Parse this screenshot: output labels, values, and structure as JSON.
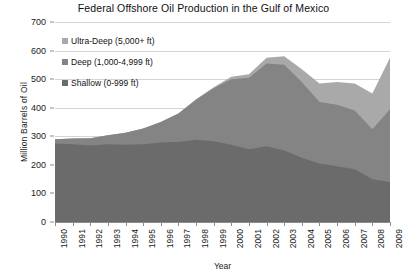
{
  "chart_data": {
    "type": "area",
    "stacked": true,
    "title": "Federal Offshore Oil Production in the Gulf of Mexico",
    "xlabel": "Year",
    "ylabel": "Million Barrels of Oil",
    "ylim": [
      0,
      700
    ],
    "ytick_step": 100,
    "yticks": [
      0,
      100,
      200,
      300,
      400,
      500,
      600,
      700
    ],
    "grid": true,
    "legend_position": "inside-top-left",
    "categories": [
      "1990",
      "1991",
      "1992",
      "1993",
      "1994",
      "1995",
      "1996",
      "1997",
      "1998",
      "1999",
      "2000",
      "2001",
      "2002",
      "2003",
      "2004",
      "2005",
      "2006",
      "2007",
      "2008",
      "2009"
    ],
    "series": [
      {
        "name": "Shallow (0-999  ft)",
        "color": "#6b6b6b",
        "values": [
          275,
          272,
          268,
          272,
          270,
          272,
          278,
          280,
          288,
          283,
          270,
          255,
          265,
          250,
          225,
          205,
          195,
          185,
          150,
          140
        ]
      },
      {
        "name": "Deep (1,000-4,999  ft)",
        "color": "#848484",
        "values": [
          15,
          20,
          25,
          32,
          42,
          55,
          72,
          100,
          140,
          185,
          230,
          250,
          290,
          300,
          265,
          215,
          215,
          205,
          175,
          255
        ]
      },
      {
        "name": "Ultra-Deep (5,000+  ft)",
        "color": "#a9a9a9",
        "values": [
          0,
          0,
          0,
          0,
          0,
          0,
          0,
          0,
          2,
          4,
          8,
          12,
          20,
          30,
          45,
          65,
          80,
          95,
          125,
          180
        ]
      }
    ],
    "series_order_bottom_to_top": [
      "Shallow (0-999  ft)",
      "Deep (1,000-4,999  ft)",
      "Ultra-Deep (5,000+  ft)"
    ],
    "totals": [
      290,
      292,
      293,
      304,
      312,
      327,
      350,
      380,
      430,
      472,
      508,
      517,
      575,
      580,
      535,
      485,
      490,
      485,
      450,
      575
    ],
    "colors": {
      "shallow": "#6b6b6b",
      "deep": "#848484",
      "ultra_deep": "#a9a9a9",
      "gridline": "#d4d4d4",
      "axis": "#8c8c8c",
      "text": "#1a1a1a",
      "background": "#ffffff"
    }
  },
  "legend": {
    "items": [
      {
        "label": "Ultra-Deep (5,000+  ft)",
        "color": "#a9a9a9"
      },
      {
        "label": "Deep (1,000-4,999  ft)",
        "color": "#848484"
      },
      {
        "label": "Shallow (0-999  ft)",
        "color": "#6b6b6b"
      }
    ]
  }
}
